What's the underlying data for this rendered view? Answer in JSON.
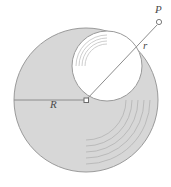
{
  "figure": {
    "background_color": "#ffffff",
    "disk_fill_color": "#d7d7d7",
    "inner_fill_color": "#ffffff",
    "stroke_color": "#9a9a9a",
    "line_color": "#8c8c8c",
    "label_color": "#4a4a4a",
    "labels": {
      "point_p": "P",
      "radius_small": "r",
      "radius_large": "R"
    },
    "geometry": {
      "outer_circle": {
        "cx": 86,
        "cy": 100,
        "r": 72
      },
      "inner_circle": {
        "cx": 107,
        "cy": 66,
        "r": 35
      },
      "center_marker": {
        "x": 86,
        "y": 100,
        "size": 4
      },
      "point_p_marker": {
        "cx": 159,
        "cy": 22,
        "r": 2.6
      },
      "radius_R_line": {
        "x1": 14,
        "y1": 100,
        "x2": 86,
        "y2": 100
      },
      "radius_r_line": {
        "x1": 86,
        "y1": 100,
        "x2": 156,
        "y2": 26
      },
      "motion_arcs_outer": [
        64,
        58,
        52,
        46,
        40
      ],
      "motion_arcs_inner": [
        31,
        28,
        25,
        22
      ]
    }
  }
}
